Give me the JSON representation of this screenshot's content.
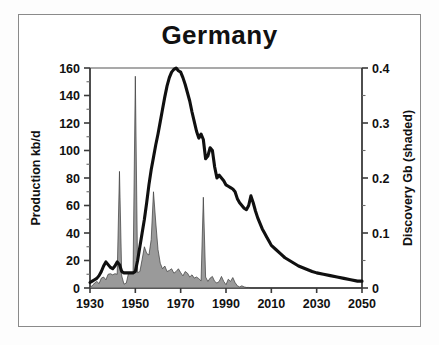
{
  "chart_data": {
    "type": "line",
    "title": "Germany",
    "xlabel": "",
    "ylabel": "Production kb/d",
    "y2label": "Discovery Gb (shaded)",
    "xlim": [
      1930,
      2050
    ],
    "ylim": [
      0,
      160
    ],
    "y2lim": [
      0,
      0.4
    ],
    "grid": false,
    "legend": "none",
    "xticks": [
      "1930",
      "1950",
      "1970",
      "1990",
      "2010",
      "2030",
      "2050"
    ],
    "xtick_values": [
      1930,
      1950,
      1970,
      1990,
      2010,
      2030,
      2050
    ],
    "yticks": [
      "0",
      "20",
      "40",
      "60",
      "80",
      "100",
      "120",
      "140",
      "160"
    ],
    "ytick_values": [
      0,
      20,
      40,
      60,
      80,
      100,
      120,
      140,
      160
    ],
    "y2ticks": [
      "0",
      "0.1",
      "0.2",
      "0.3",
      "0.4"
    ],
    "y2tick_values": [
      0,
      0.1,
      0.2,
      0.3,
      0.4
    ],
    "minor_tick_step_left": 10,
    "minor_tick_step_right": 0.05,
    "series": [
      {
        "name": "Production kb/d",
        "axis": "left",
        "style": "thick-black-line",
        "color": "#101010",
        "x": [
          1930,
          1931,
          1932,
          1933,
          1934,
          1935,
          1936,
          1937,
          1938,
          1939,
          1940,
          1941,
          1942,
          1943,
          1944,
          1945,
          1946,
          1947,
          1948,
          1949,
          1950,
          1951,
          1952,
          1953,
          1954,
          1955,
          1956,
          1957,
          1958,
          1959,
          1960,
          1961,
          1962,
          1963,
          1964,
          1965,
          1966,
          1967,
          1968,
          1969,
          1970,
          1971,
          1972,
          1973,
          1974,
          1975,
          1976,
          1977,
          1978,
          1979,
          1980,
          1981,
          1982,
          1983,
          1984,
          1985,
          1986,
          1987,
          1988,
          1989,
          1990,
          1991,
          1992,
          1993,
          1994,
          1995,
          1996,
          1997,
          1998,
          1999,
          2000,
          2001,
          2002,
          2003,
          2004,
          2005,
          2006,
          2007,
          2008,
          2009,
          2010,
          2012,
          2014,
          2016,
          2018,
          2020,
          2022,
          2025,
          2028,
          2030,
          2033,
          2036,
          2039,
          2042,
          2045,
          2048,
          2050
        ],
        "y": [
          4,
          5,
          6,
          7,
          9,
          12,
          16,
          19,
          17,
          15,
          14,
          16,
          19,
          17,
          12,
          11,
          11,
          11,
          11,
          11,
          12,
          20,
          30,
          40,
          50,
          62,
          75,
          86,
          95,
          104,
          112,
          121,
          130,
          139,
          147,
          153,
          157,
          159,
          160,
          158,
          157,
          153,
          148,
          142,
          136,
          128,
          121,
          114,
          109,
          112,
          108,
          94,
          96,
          102,
          100,
          88,
          80,
          82,
          80,
          78,
          75,
          74,
          73,
          72,
          70,
          65,
          62,
          60,
          58,
          57,
          60,
          67,
          62,
          56,
          51,
          47,
          43,
          40,
          37,
          34,
          31,
          28,
          25,
          22,
          20,
          18,
          16,
          14,
          12,
          11,
          10,
          9,
          8,
          7,
          6,
          5,
          5
        ]
      },
      {
        "name": "Discovery Gb (shaded)",
        "axis": "right",
        "style": "grey-filled-area",
        "fill": "#9a9a9a",
        "edge": "#3a3a3a",
        "x": [
          1930,
          1931,
          1932,
          1933,
          1934,
          1935,
          1936,
          1937,
          1938,
          1939,
          1940,
          1941,
          1942,
          1943,
          1944,
          1945,
          1946,
          1947,
          1948,
          1949,
          1950,
          1951,
          1952,
          1953,
          1954,
          1955,
          1956,
          1957,
          1958,
          1959,
          1960,
          1961,
          1962,
          1963,
          1964,
          1965,
          1966,
          1967,
          1968,
          1969,
          1970,
          1971,
          1972,
          1973,
          1974,
          1975,
          1976,
          1977,
          1978,
          1979,
          1980,
          1981,
          1982,
          1983,
          1984,
          1985,
          1986,
          1987,
          1988,
          1989,
          1990,
          1991,
          1992,
          1993,
          1994,
          1995,
          1996,
          1997,
          1998,
          1999,
          2000,
          2001,
          2002,
          2003,
          2004,
          2005,
          2006,
          2007,
          2008,
          2009,
          2010,
          2015,
          2020,
          2030,
          2040,
          2050
        ],
        "y": [
          0.002,
          0.004,
          0.009,
          0.012,
          0.008,
          0.018,
          0.02,
          0.015,
          0.025,
          0.026,
          0.024,
          0.026,
          0.025,
          0.212,
          0.022,
          0.007,
          0.009,
          0.027,
          0.027,
          0.027,
          0.385,
          0.028,
          0.03,
          0.052,
          0.075,
          0.063,
          0.06,
          0.088,
          0.175,
          0.12,
          0.07,
          0.045,
          0.035,
          0.04,
          0.03,
          0.032,
          0.035,
          0.027,
          0.03,
          0.035,
          0.028,
          0.022,
          0.03,
          0.027,
          0.02,
          0.024,
          0.018,
          0.02,
          0.017,
          0.013,
          0.165,
          0.02,
          0.012,
          0.018,
          0.021,
          0.012,
          0.009,
          0.012,
          0.021,
          0.012,
          0.006,
          0.016,
          0.012,
          0.019,
          0.01,
          0.004,
          0.002,
          0.004,
          0.002,
          0.001,
          0.001,
          0.0,
          0.0,
          0.0,
          0.0,
          0.0,
          0.0,
          0.0,
          0.0,
          0.0,
          0.0,
          0.0,
          0.0,
          0.0,
          0.0,
          0.0
        ]
      }
    ],
    "annotations": [
      {
        "text": "production peak ~160 kb/d near 1968"
      },
      {
        "text": "largest discovery spike ~0.385 Gb in 1950"
      },
      {
        "text": "secondary discovery spikes in 1943, 1958, 1980"
      },
      {
        "text": "late production bump ~67 kb/d near 2001"
      }
    ]
  },
  "axes": {
    "left_title": "Production kb/d",
    "right_title": "Discovery Gb (shaded)"
  },
  "colors": {
    "line": "#101010",
    "area_fill": "#9a9a9a",
    "axis": "#555555",
    "border": "#8a8a8a",
    "background": "#ffffff"
  }
}
